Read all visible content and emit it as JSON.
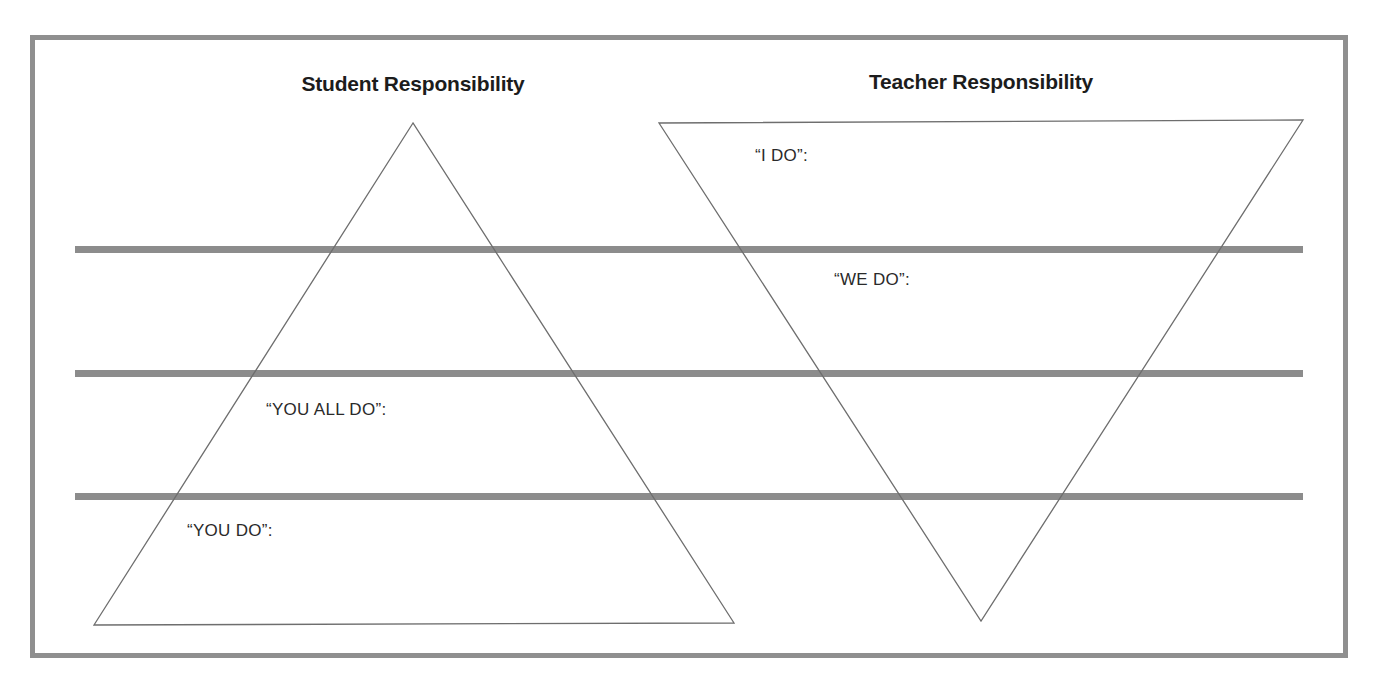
{
  "diagram": {
    "title_left": "Student Responsibility",
    "title_right": "Teacher Responsibility",
    "colors": {
      "frame": "#8f8f8f",
      "divider": "#8c8c8c",
      "triangle_stroke": "#6e6e6e",
      "text": "#2a2a2a",
      "background": "#ffffff"
    },
    "student_triangle": {
      "orientation": "upright",
      "labels": [
        {
          "id": "you-all-do",
          "text": "“YOU ALL DO”:"
        },
        {
          "id": "you-do",
          "text": "“YOU DO”:"
        }
      ]
    },
    "teacher_triangle": {
      "orientation": "inverted",
      "labels": [
        {
          "id": "i-do",
          "text": "“I DO”:"
        },
        {
          "id": "we-do",
          "text": "“WE DO”:"
        }
      ]
    },
    "divider_count": 3
  }
}
